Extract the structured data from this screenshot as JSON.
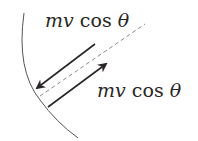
{
  "diagram": {
    "labels": {
      "incoming": {
        "var": "mv",
        "func": "cos",
        "angle": "θ"
      },
      "outgoing": {
        "var": "mv",
        "func": "cos",
        "angle": "θ"
      }
    },
    "elements": {
      "wall": "curved-surface-arc",
      "normal": "dashed-normal-line",
      "incoming_arrow": "arrow-toward-wall",
      "outgoing_arrow": "arrow-away-from-wall"
    },
    "colors": {
      "stroke": "#2a2626",
      "arc": "#555555",
      "dashed": "#8a8a8a",
      "background": "#ffffff"
    }
  }
}
